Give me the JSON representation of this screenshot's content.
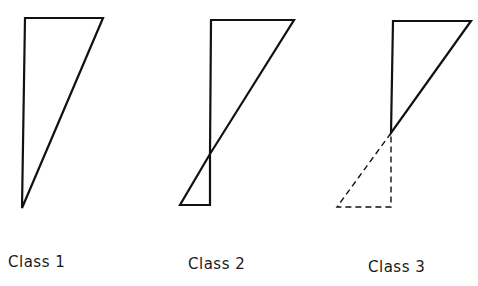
{
  "diagram": {
    "panels": [
      {
        "label": "Class 1",
        "solid_polygon": "25,18 103,18 22,208",
        "solid_lower": "",
        "dashed_lower": ""
      },
      {
        "label": "Class 2",
        "solid_polygon": "211,20 294,20 210,154",
        "solid_lower": "210,154 180,205 210,205 210,154",
        "dashed_lower": ""
      },
      {
        "label": "Class 3",
        "solid_polygon": "393,21 471,21 391,133",
        "solid_lower": "",
        "dashed_lower": "391,133 337,207 391,207 391,133"
      }
    ],
    "colors": {
      "stroke": "#111111",
      "background": "#ffffff"
    }
  }
}
